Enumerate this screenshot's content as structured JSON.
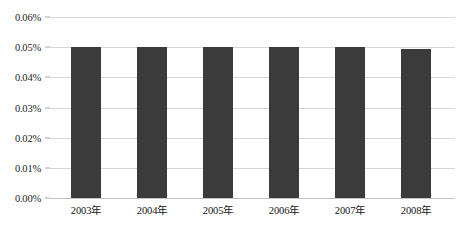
{
  "chart_data": {
    "type": "bar",
    "title": "",
    "subtitle": "",
    "xlabel": "",
    "ylabel": "",
    "categories": [
      "2003年",
      "2004年",
      "2005年",
      "2006年",
      "2007年",
      "2008年"
    ],
    "values": [
      0.05,
      0.05,
      0.05,
      0.05,
      0.05,
      0.0495
    ],
    "value_labels": [
      "0.050%",
      "0.050%",
      "0.050%",
      "0.050%",
      "0.050%",
      "0.0495%"
    ],
    "series": [
      {
        "name": "",
        "values": [
          0.05,
          0.05,
          0.05,
          0.05,
          0.05,
          0.0495
        ]
      }
    ],
    "ylim": [
      0.0,
      0.06
    ],
    "ytick_values": [
      0.06,
      0.05,
      0.04,
      0.03,
      0.02,
      0.01,
      0.0
    ],
    "ytick_labels": [
      "0.06%",
      "0.05%",
      "0.04%",
      "0.03%",
      "0.02%",
      "0.01%",
      "0.00%"
    ],
    "grid": true,
    "legend": false,
    "legend_position": "none",
    "annotations": [],
    "colors": {
      "bar": "#3b3b3b",
      "gridline": "#d6d6d6",
      "baseline": "#c2c2c2",
      "background": "#ffffff",
      "tick_text": "#1d1d1d"
    }
  },
  "axes": {
    "y_ticks": [
      {
        "label": "0.06%",
        "value": 0.06
      },
      {
        "label": "0.05%",
        "value": 0.05
      },
      {
        "label": "0.04%",
        "value": 0.04
      },
      {
        "label": "0.03%",
        "value": 0.03
      },
      {
        "label": "0.02%",
        "value": 0.02
      },
      {
        "label": "0.01%",
        "value": 0.01
      },
      {
        "label": "0.00%",
        "value": 0.0
      }
    ],
    "x_ticks": [
      {
        "label": "2003年"
      },
      {
        "label": "2004年"
      },
      {
        "label": "2005年"
      },
      {
        "label": "2006年"
      },
      {
        "label": "2007年"
      },
      {
        "label": "2008年"
      }
    ]
  },
  "caption": {
    "text": ""
  }
}
